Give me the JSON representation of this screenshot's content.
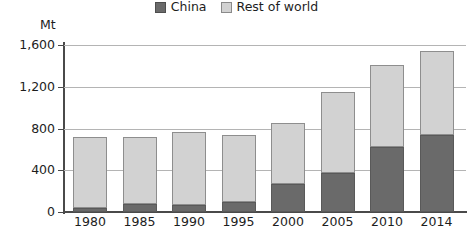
{
  "chart_data": {
    "type": "bar",
    "subtype": "stacked-vertical",
    "title": "",
    "subtitle": "",
    "xlabel": "",
    "ylabel": "Mt",
    "unit_label": "Mt",
    "categories": [
      "1980",
      "1985",
      "1990",
      "1995",
      "2000",
      "2005",
      "2010",
      "2014"
    ],
    "series": [
      {
        "name": "China",
        "color": "#6a6a6a",
        "values": [
          40,
          75,
          65,
          95,
          265,
          375,
          620,
          740
        ]
      },
      {
        "name": "Rest of world",
        "color": "#d2d2d2",
        "values": [
          680,
          645,
          700,
          640,
          585,
          775,
          790,
          800
        ]
      }
    ],
    "totals": [
      720,
      720,
      765,
      735,
      850,
      1150,
      1410,
      1540
    ],
    "ylim": [
      0,
      1600
    ],
    "ytick_values": [
      0,
      400,
      800,
      1200,
      1600
    ],
    "ytick_labels": [
      "0",
      "400",
      "800",
      "1,200",
      "1,600"
    ],
    "grid": true,
    "grid_axis": "y",
    "legend_position": "top-center",
    "legend_entries": [
      "China",
      "Rest of world"
    ]
  },
  "legend": {
    "items": [
      {
        "label": "China",
        "swatch": "china-swatch"
      },
      {
        "label": "Rest of world",
        "swatch": "rest-of-world-swatch"
      }
    ]
  },
  "colors": {
    "china": "#6a6a6a",
    "rest_of_world": "#d2d2d2",
    "axis": "#4a4a4a",
    "gridline": "#b4b4b4",
    "background": "#ffffff",
    "text": "#1d1d1d"
  }
}
